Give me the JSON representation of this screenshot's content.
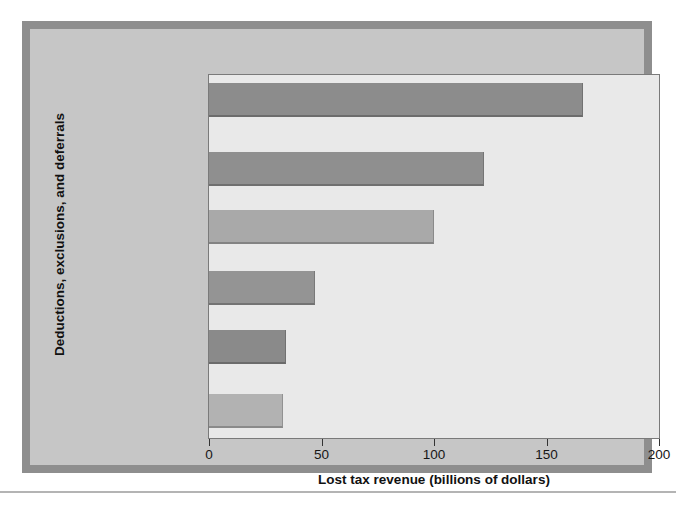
{
  "chart_data": {
    "type": "bar",
    "orientation": "horizontal",
    "title": "",
    "xlabel": "Lost tax revenue (billions of dollars)",
    "ylabel": "Deductions, exclusions, and deferrals",
    "xlim": [
      0,
      200
    ],
    "xticks": [
      0,
      50,
      100,
      150,
      200
    ],
    "xtick_labels": [
      "0",
      "50",
      "100",
      "150",
      "200"
    ],
    "grid": false,
    "legend": false,
    "categories": [
      "Employer-paid\nhealth benefits",
      "Pension\ncontributions\nand interest",
      "Home mortgage\ndeduction",
      "Charitable\ncontributions",
      "Capital gains\nexclusion on\nhome sales",
      "State and local\ntax deductibility"
    ],
    "values": [
      166,
      122,
      100,
      47,
      34,
      33
    ],
    "bar_colors": [
      "#8c8c8c",
      "#8f8f8f",
      "#a9a9a9",
      "#949494",
      "#8a8a8a",
      "#b2b2b2"
    ]
  },
  "figure": {
    "frame_color": "#8e8e8e",
    "panel_color": "#c6c6c6",
    "plot_bg_color": "#e9e9e9",
    "axis_color": "#333333",
    "text_color": "#161616"
  }
}
